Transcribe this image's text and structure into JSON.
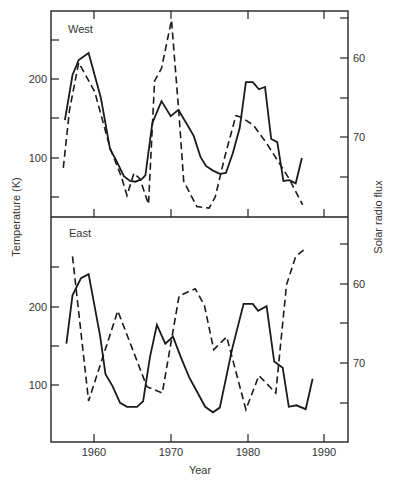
{
  "chart_data": {
    "type": "line",
    "layout": "two stacked panels sharing x axis, dual y axes",
    "xlabel": "Year",
    "ylabel_left": "Temperature (K)",
    "ylabel_right": "Solar radio flux",
    "x_ticks": [
      1960,
      1970,
      1980,
      1990
    ],
    "xlim": [
      1954.5,
      1993.5
    ],
    "legend": "none (solid = temperature, dashed = solar radio flux, right axis inverted)",
    "grid": false,
    "panels": [
      {
        "label": "West",
        "left_axis": {
          "ticks": [
            100,
            200
          ],
          "minor_ticks": [
            50,
            150,
            250
          ],
          "ylim": [
            36,
            294
          ]
        },
        "right_axis": {
          "ticks": [
            60,
            70
          ],
          "minor_ticks": [
            55,
            65,
            75
          ],
          "inverted": true,
          "ylim": [
            53.3,
            79.4
          ]
        },
        "series": [
          {
            "name": "Temperature",
            "style": "solid",
            "axis": "left",
            "x": [
              1956.2,
              1957.2,
              1958.0,
              1959.3,
              1960.9,
              1962.1,
              1962.9,
              1963.9,
              1964.7,
              1965.4,
              1966.2,
              1966.7,
              1967.6,
              1968.8,
              1970.0,
              1971.0,
              1972.1,
              1973.0,
              1973.9,
              1974.6,
              1975.5,
              1976.4,
              1977.2,
              1978.1,
              1979.0,
              1979.8,
              1980.7,
              1981.5,
              1982.3,
              1983.1,
              1983.9,
              1984.7,
              1985.5,
              1986.3,
              1987.1
            ],
            "values": [
              148,
              205,
              224,
              233,
              176,
              111,
              97,
              77,
              71,
              70,
              73,
              78,
              144,
              172,
              153,
              161,
              143,
              128,
              101,
              90,
              84,
              80,
              81,
              106,
              138,
              196,
              196,
              187,
              190,
              124,
              120,
              71,
              72,
              68,
              100
            ]
          },
          {
            "name": "Solar radio flux",
            "style": "dashed",
            "axis": "right",
            "x": [
              1956.0,
              1956.8,
              1958.0,
              1958.7,
              1960.1,
              1962.1,
              1963.6,
              1964.3,
              1965.2,
              1966.0,
              1967.1,
              1967.9,
              1968.8,
              1970.1,
              1971.1,
              1971.7,
              1973.4,
              1975.0,
              1975.8,
              1977.1,
              1978.5,
              1979.2,
              1980.8,
              1982.5,
              1985.4,
              1987.2
            ],
            "values": [
              73.9,
              66.6,
              60.6,
              61.8,
              64.3,
              71.4,
              75.1,
              77.4,
              74.6,
              75.3,
              78.5,
              62.9,
              61.3,
              55.2,
              67.3,
              75.6,
              78.8,
              79.0,
              77.6,
              72.3,
              67.3,
              67.5,
              68.5,
              70.8,
              75.2,
              78.6
            ]
          }
        ]
      },
      {
        "label": "East",
        "left_axis": {
          "ticks": [
            100,
            200
          ],
          "minor_ticks": [
            150,
            250
          ],
          "ylim": [
            27,
            311
          ]
        },
        "right_axis": {
          "ticks": [
            60,
            70
          ],
          "minor_ticks": [
            55,
            65,
            75
          ],
          "inverted": true,
          "ylim": [
            52.1,
            79.8
          ]
        },
        "series": [
          {
            "name": "Temperature",
            "style": "solid",
            "axis": "left",
            "x": [
              1956.4,
              1957.2,
              1958.3,
              1959.3,
              1960.8,
              1961.5,
              1962.4,
              1963.4,
              1964.3,
              1965.6,
              1966.4,
              1967.3,
              1968.2,
              1969.3,
              1970.3,
              1971.3,
              1972.4,
              1973.4,
              1974.5,
              1975.5,
              1976.4,
              1978.0,
              1979.5,
              1980.7,
              1981.4,
              1982.5,
              1983.5,
              1984.6,
              1985.4,
              1986.4,
              1987.6,
              1988.5
            ],
            "values": [
              153,
              215,
              237,
              242,
              163,
              114,
              99,
              77,
              72,
              72,
              79,
              136,
              177,
              153,
              162,
              136,
              110,
              92,
              72,
              65,
              71,
              146,
              204,
              204,
              195,
              201,
              130,
              122,
              72,
              74,
              69,
              108
            ]
          },
          {
            "name": "Solar radio flux",
            "style": "dashed",
            "axis": "right",
            "x": [
              1957.2,
              1959.3,
              1963.1,
              1966.9,
              1968.9,
              1971.1,
              1973.2,
              1974.4,
              1975.6,
              1977.3,
              1979.8,
              1981.5,
              1983.7,
              1985.1,
              1986.3,
              1987.5
            ],
            "values": [
              56.5,
              74.8,
              63.4,
              73.0,
              73.8,
              61.5,
              60.6,
              62.7,
              68.3,
              66.7,
              75.9,
              71.6,
              73.8,
              60.1,
              56.5,
              55.6
            ]
          }
        ]
      }
    ]
  },
  "labels": {
    "panel_west": "West",
    "panel_east": "East",
    "xlabel": "Year",
    "ylabel_left": "Temperature (K)",
    "ylabel_right": "Solar radio flux",
    "x_ticks": [
      "1960",
      "1970",
      "1980",
      "1990"
    ],
    "west_left_ticks": [
      "200",
      "100"
    ],
    "west_right_ticks": [
      "60",
      "70"
    ],
    "east_left_ticks": [
      "200",
      "100"
    ],
    "east_right_ticks": [
      "60",
      "70"
    ]
  }
}
